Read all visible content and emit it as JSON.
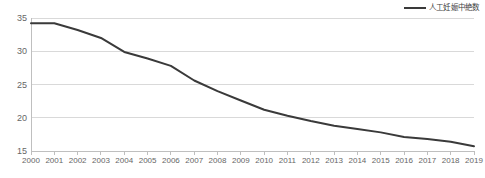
{
  "chart_data": {
    "type": "line",
    "title": "",
    "subtitle": "",
    "xlabel": "",
    "ylabel": "",
    "categories": [
      "2000",
      "2001",
      "2002",
      "2003",
      "2004",
      "2005",
      "2006",
      "2007",
      "2008",
      "2009",
      "2010",
      "2011",
      "2012",
      "2013",
      "2014",
      "2015",
      "2016",
      "2017",
      "2018",
      "2019"
    ],
    "series": [
      {
        "name": "人工妊娠中絶数",
        "color": "#3a3a3a",
        "values": [
          34.2,
          34.2,
          33.2,
          32.0,
          29.9,
          28.9,
          27.8,
          25.6,
          24.0,
          22.6,
          21.2,
          20.3,
          19.5,
          18.8,
          18.3,
          17.8,
          17.1,
          16.8,
          16.4,
          15.7
        ]
      }
    ],
    "ylim": [
      15,
      35
    ],
    "yticks": [
      15,
      20,
      25,
      30,
      35
    ],
    "xlim": [
      "2000",
      "2019"
    ],
    "grid": true,
    "grid_axis": "y",
    "grid_color": "#d9d9d9",
    "axis_color": "#bfbfbf",
    "legend_position": "top-right",
    "annotations": []
  },
  "legend": {
    "entries": [
      {
        "label": "人工妊娠中絶数"
      }
    ]
  }
}
